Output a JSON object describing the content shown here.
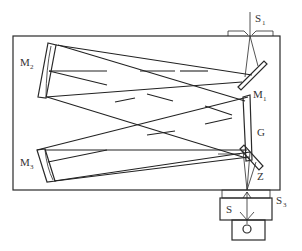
{
  "diagram": {
    "labels": {
      "s1": {
        "main": "S",
        "sub": "1"
      },
      "m1": {
        "main": "M",
        "sub": "1"
      },
      "m2": {
        "main": "M",
        "sub": "2"
      },
      "m3": {
        "main": "M",
        "sub": "3"
      },
      "g": {
        "main": "G"
      },
      "z": {
        "main": "Z"
      },
      "s3": {
        "main": "S",
        "sub": "3"
      },
      "s": {
        "main": "S"
      }
    },
    "components": [
      {
        "id": "entrance-slit",
        "label": "S1"
      },
      {
        "id": "plane-mirror-m1",
        "label": "M1"
      },
      {
        "id": "concave-mirror-m2",
        "label": "M2"
      },
      {
        "id": "grating",
        "label": "G"
      },
      {
        "id": "concave-mirror-m3",
        "label": "M3"
      },
      {
        "id": "fold-mirror-z",
        "label": "Z"
      },
      {
        "id": "exit-slit",
        "label": "S3"
      },
      {
        "id": "shutter-s",
        "label": "S"
      },
      {
        "id": "detector",
        "label": ""
      }
    ],
    "colors": {
      "line": "#2a2a2a",
      "background": "#ffffff"
    }
  }
}
